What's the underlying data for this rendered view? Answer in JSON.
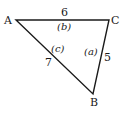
{
  "diagram": {
    "type": "triangle",
    "stroke_color": "#1a1a1a",
    "vertices": {
      "A": {
        "label": "A",
        "x": 16,
        "y": 20
      },
      "B": {
        "label": "B",
        "x": 93,
        "y": 94
      },
      "C": {
        "label": "C",
        "x": 109,
        "y": 20
      }
    },
    "sides": {
      "AC": {
        "length": "6",
        "name": "(b)"
      },
      "AB": {
        "length": "7",
        "name": "(c)"
      },
      "CB": {
        "length": "5",
        "name": "(a)"
      }
    }
  }
}
